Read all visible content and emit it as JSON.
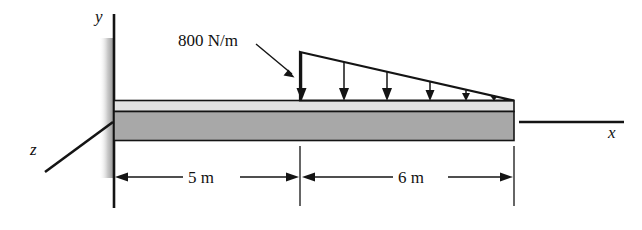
{
  "figure": {
    "type": "engineering-free-body-diagram"
  },
  "axes": {
    "y_label": "y",
    "x_label": "x",
    "z_label": "z"
  },
  "load": {
    "label": "800 N/m",
    "magnitude": 800,
    "unit": "N/m",
    "distribution": "linearly-decreasing-triangular",
    "peak_at": "left-end-of-loaded-span",
    "zero_at": "free-end",
    "arrow_count": 6,
    "direction": "downward"
  },
  "dimensions": [
    {
      "label": "5 m",
      "value": 5,
      "unit": "m",
      "span": "wall-to-load-start"
    },
    {
      "label": "6 m",
      "value": 6,
      "unit": "m",
      "span": "load-start-to-free-end"
    }
  ],
  "beam": {
    "support": "fixed-wall-at-left",
    "total_length_label": "11 m",
    "fill_color": "#a8a8a8",
    "flange_color": "#e2e2e2",
    "outline_color": "#141414"
  }
}
